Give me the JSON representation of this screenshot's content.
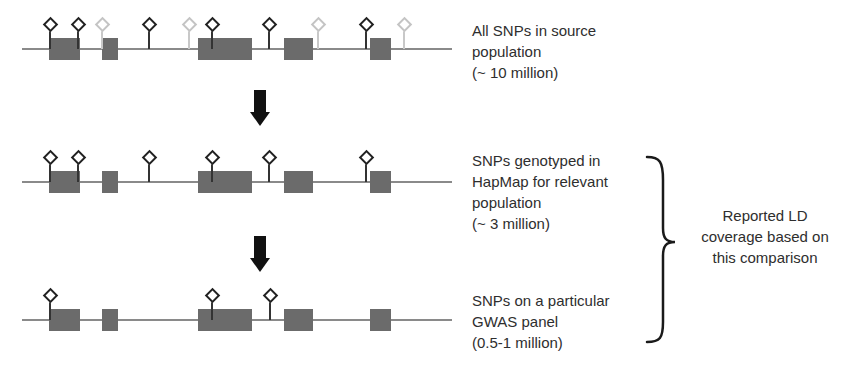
{
  "tracks": [
    {
      "id": "source",
      "line_y": 49,
      "label_lines": [
        "All SNPs in source",
        "population",
        "(~ 10 million)"
      ],
      "snps": [
        {
          "x": 50,
          "shade": "dark"
        },
        {
          "x": 78,
          "shade": "dark"
        },
        {
          "x": 102,
          "shade": "light"
        },
        {
          "x": 149,
          "shade": "dark"
        },
        {
          "x": 189,
          "shade": "light"
        },
        {
          "x": 212,
          "shade": "dark"
        },
        {
          "x": 269,
          "shade": "dark"
        },
        {
          "x": 318,
          "shade": "light"
        },
        {
          "x": 366,
          "shade": "dark"
        },
        {
          "x": 404,
          "shade": "light"
        }
      ]
    },
    {
      "id": "hapmap",
      "line_y": 182,
      "label_lines": [
        "SNPs genotyped in",
        "HapMap for relevant",
        "population",
        "(~ 3 million)"
      ],
      "snps": [
        {
          "x": 50,
          "shade": "dark"
        },
        {
          "x": 78,
          "shade": "dark"
        },
        {
          "x": 149,
          "shade": "dark"
        },
        {
          "x": 212,
          "shade": "dark"
        },
        {
          "x": 269,
          "shade": "dark"
        },
        {
          "x": 366,
          "shade": "dark"
        }
      ]
    },
    {
      "id": "gwas",
      "line_y": 320,
      "label_lines": [
        "SNPs on a particular",
        "GWAS panel",
        "(0.5-1 million)"
      ],
      "snps": [
        {
          "x": 50,
          "shade": "dark"
        },
        {
          "x": 212,
          "shade": "dark"
        },
        {
          "x": 270,
          "shade": "dark"
        }
      ]
    }
  ],
  "exons": [
    {
      "x1": 49,
      "x2": 80
    },
    {
      "x1": 102,
      "x2": 118
    },
    {
      "x1": 198,
      "x2": 252
    },
    {
      "x1": 284,
      "x2": 313
    },
    {
      "x1": 370,
      "x2": 391
    }
  ],
  "line_extent": {
    "x1": 22,
    "x2": 452
  },
  "arrows": [
    {
      "y": 94
    },
    {
      "y": 240
    }
  ],
  "summary": {
    "lines": [
      "Reported LD",
      "coverage based on",
      "this comparison"
    ]
  },
  "colors": {
    "exon": "#6b6b6b",
    "genome_line": "#8a8a8a",
    "snp_dark": "#222222",
    "snp_light": "#c4c4c4",
    "arrow": "#111111"
  }
}
